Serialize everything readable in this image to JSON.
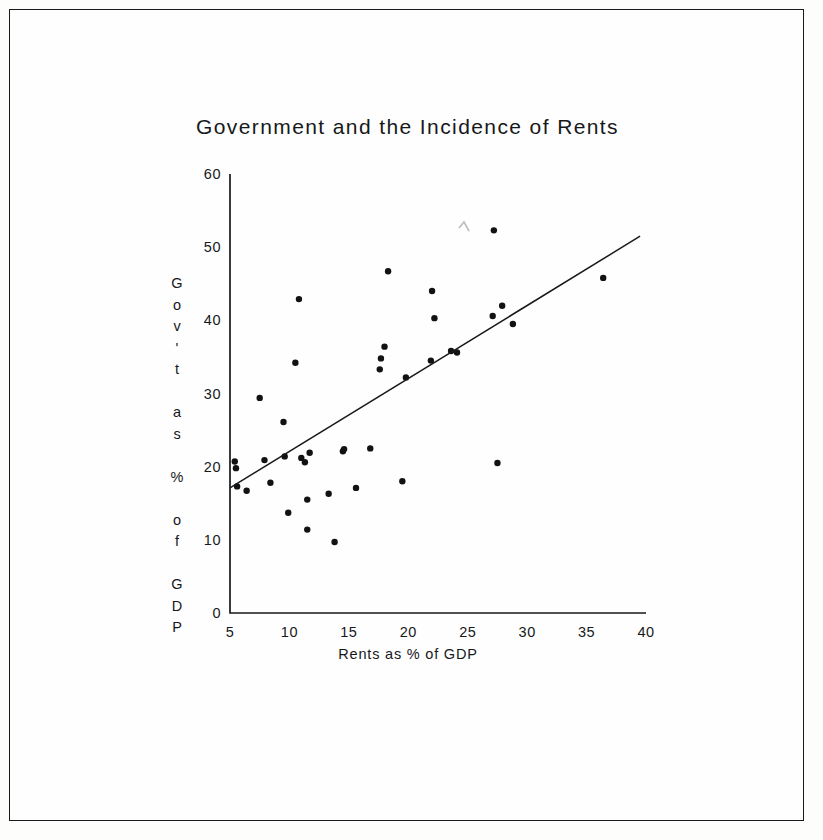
{
  "figure": {
    "title": "Government and the Incidence of Rents",
    "background_color": "#fefefe",
    "frame_color": "#1a1a1a",
    "ink_color": "#17181a"
  },
  "chart_data": {
    "type": "scatter",
    "title": "Government and the Incidence of Rents",
    "xlabel": "Rents as % of GDP",
    "ylabel": "Gov't as % of GDP",
    "ylabel_chars": [
      "G",
      "o",
      "v",
      "'",
      "t",
      "",
      "a",
      "s",
      "",
      "%",
      "",
      "o",
      "f",
      "",
      "G",
      "D",
      "P"
    ],
    "xlim": [
      5,
      40
    ],
    "ylim": [
      0,
      60
    ],
    "xticks": [
      5,
      10,
      15,
      20,
      25,
      30,
      35,
      40
    ],
    "yticks": [
      0,
      10,
      20,
      30,
      40,
      50,
      60
    ],
    "xtick_labels": [
      "5",
      "10",
      "15",
      "20",
      "25",
      "30",
      "35",
      "40"
    ],
    "ytick_labels": [
      "0",
      "10",
      "20",
      "30",
      "40",
      "50",
      "60"
    ],
    "grid": false,
    "legend": false,
    "marker": "filled-circle",
    "marker_color": "#111214",
    "marker_size": 3.2,
    "points": [
      {
        "x": 5.4,
        "y": 20.7
      },
      {
        "x": 5.5,
        "y": 19.8
      },
      {
        "x": 5.6,
        "y": 17.3
      },
      {
        "x": 6.4,
        "y": 16.7
      },
      {
        "x": 7.5,
        "y": 29.4
      },
      {
        "x": 7.9,
        "y": 20.9
      },
      {
        "x": 8.4,
        "y": 17.8
      },
      {
        "x": 9.5,
        "y": 26.1
      },
      {
        "x": 9.6,
        "y": 21.4
      },
      {
        "x": 9.9,
        "y": 13.7
      },
      {
        "x": 10.5,
        "y": 34.2
      },
      {
        "x": 10.8,
        "y": 42.9
      },
      {
        "x": 11.0,
        "y": 21.2
      },
      {
        "x": 11.3,
        "y": 20.6
      },
      {
        "x": 11.5,
        "y": 15.5
      },
      {
        "x": 11.5,
        "y": 11.4
      },
      {
        "x": 11.7,
        "y": 21.9
      },
      {
        "x": 13.3,
        "y": 16.3
      },
      {
        "x": 13.8,
        "y": 9.7
      },
      {
        "x": 14.5,
        "y": 22.1
      },
      {
        "x": 14.6,
        "y": 22.4
      },
      {
        "x": 15.6,
        "y": 17.1
      },
      {
        "x": 16.8,
        "y": 22.5
      },
      {
        "x": 17.6,
        "y": 33.3
      },
      {
        "x": 17.7,
        "y": 34.8
      },
      {
        "x": 18.0,
        "y": 36.4
      },
      {
        "x": 18.3,
        "y": 46.7
      },
      {
        "x": 19.5,
        "y": 18.0
      },
      {
        "x": 19.8,
        "y": 32.2
      },
      {
        "x": 21.9,
        "y": 34.5
      },
      {
        "x": 22.0,
        "y": 44.0
      },
      {
        "x": 22.2,
        "y": 40.3
      },
      {
        "x": 23.6,
        "y": 35.8
      },
      {
        "x": 24.1,
        "y": 35.6
      },
      {
        "x": 27.1,
        "y": 40.6
      },
      {
        "x": 27.2,
        "y": 52.3
      },
      {
        "x": 27.5,
        "y": 20.5
      },
      {
        "x": 27.9,
        "y": 42.0
      },
      {
        "x": 28.8,
        "y": 39.5
      },
      {
        "x": 36.4,
        "y": 45.8
      }
    ],
    "fit_line": {
      "x_start": 5.0,
      "y_start": 17.1,
      "x_end": 39.5,
      "y_end": 51.5,
      "style": "solid",
      "color": "#17181a"
    }
  }
}
